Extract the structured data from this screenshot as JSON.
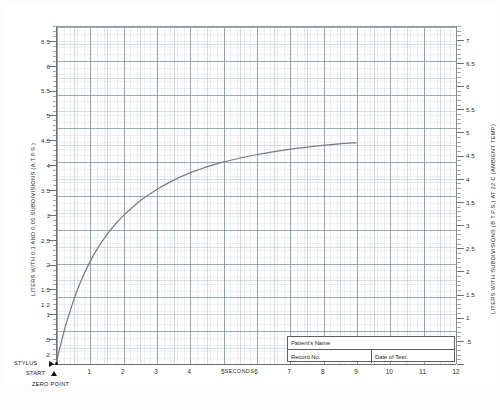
{
  "chart": {
    "type_label": "spirogram",
    "axes": {
      "x": {
        "title": "SECONDS",
        "ticks": [
          1,
          2,
          3,
          4,
          5,
          6,
          7,
          8,
          9,
          10,
          11,
          12
        ],
        "min": 0,
        "max": 12
      },
      "y_left": {
        "title": "LITERS WITH 0.1 AND 0.05 SUBDIVISIONS (A.T.P.S.)",
        "ticks": [
          "6.5",
          "6",
          "5.5",
          "5",
          "4.5",
          "4",
          "3.5",
          "3",
          "2.5",
          "2",
          "1.5",
          "1.2",
          "1",
          ".5",
          ".2"
        ],
        "min": 0,
        "max": 6.8
      },
      "y_right": {
        "title": "LITERS WITH SUBDIVISIONS (B.T.P.S.) AT 22 C (AMBIENT TEMP)",
        "ticks": [
          "7",
          "6.5",
          "6",
          "5.5",
          "5",
          "4.5",
          "4",
          "3.5",
          "3",
          "2.5",
          "2",
          "1.5",
          "1",
          ".5"
        ],
        "min": 0,
        "max": 7.3
      }
    },
    "annotations": {
      "stylus": "STYLUS",
      "start": "START",
      "zero_point": "ZERO POINT"
    }
  },
  "info_box": {
    "patient_name_label": "Patient's Name",
    "record_no_label": "Record No.",
    "date_of_test_label": "Date of Test:"
  },
  "caption": "",
  "chart_data": {
    "type": "line",
    "title": "",
    "subtitle": "",
    "xlabel": "SECONDS",
    "ylabel": "LITERS WITH 0.1 AND 0.05 SUBDIVISIONS (A.T.P.S.)",
    "ylabel_secondary": "LITERS WITH SUBDIVISIONS (B.T.P.S.) AT 22 C (AMBIENT TEMP)",
    "xlim": [
      0,
      12
    ],
    "ylim": [
      0,
      6.8
    ],
    "ylim_secondary": [
      0,
      7.3
    ],
    "grid": true,
    "legend": "none",
    "xticks": [
      1,
      2,
      3,
      4,
      5,
      6,
      7,
      8,
      9,
      10,
      11,
      12
    ],
    "yticks_left": [
      0.2,
      0.5,
      1,
      1.2,
      1.5,
      2,
      2.5,
      3,
      3.5,
      4,
      4.5,
      5,
      5.5,
      6,
      6.5
    ],
    "yticks_right": [
      0.5,
      1,
      1.5,
      2,
      2.5,
      3,
      3.5,
      4,
      4.5,
      5,
      5.5,
      6,
      6.5,
      7
    ],
    "series": [
      {
        "name": "Expiratory volume-time tracing",
        "color": "#7a7a82",
        "x": [
          0,
          0.1,
          0.2,
          0.3,
          0.45,
          0.6,
          0.8,
          1.0,
          1.25,
          1.5,
          1.75,
          2.0,
          2.5,
          3.0,
          3.5,
          4.0,
          4.5,
          5.0,
          5.5,
          6.0,
          6.5,
          7.0,
          7.5,
          8.0,
          8.5,
          9.0
        ],
        "y": [
          0.0,
          0.28,
          0.55,
          0.8,
          1.12,
          1.42,
          1.75,
          2.03,
          2.33,
          2.58,
          2.79,
          2.97,
          3.27,
          3.5,
          3.69,
          3.84,
          3.96,
          4.06,
          4.14,
          4.21,
          4.27,
          4.32,
          4.36,
          4.4,
          4.43,
          4.45
        ]
      }
    ],
    "markers": [
      {
        "label": "ZERO POINT",
        "x": 0,
        "y": 0
      },
      {
        "label": "START",
        "x": 0,
        "y": 0
      },
      {
        "label": "STYLUS",
        "x": 0,
        "y": 0.1
      }
    ]
  }
}
